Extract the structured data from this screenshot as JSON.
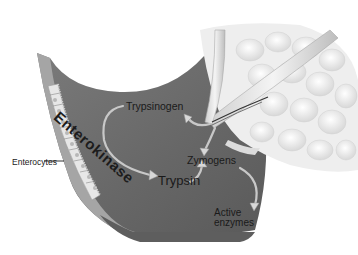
{
  "diagram": {
    "labels": {
      "enterokinase": "Enterokinase",
      "trypsinogen": "Trypsinogen",
      "zymogens": "Zymogens",
      "trypsin": "Trypsin",
      "active_line1": "Active",
      "active_line2": "enzymes",
      "enterocytes": "Enterocytes"
    },
    "structures": [
      "intestinal-wall",
      "enterocyte-layer",
      "pancreas",
      "pancreatic-duct"
    ],
    "arrows": [
      {
        "from": "Trypsinogen",
        "to": "Trypsin"
      },
      {
        "from": "pancreatic-duct",
        "to": "Trypsinogen"
      },
      {
        "from": "pancreatic-duct",
        "to": "Zymogens"
      },
      {
        "from": "Trypsin",
        "to": "Zymogens"
      },
      {
        "from": "Zymogens",
        "to": "Active enzymes"
      }
    ],
    "colors": {
      "wall": "#6f6f6f",
      "wall_light": "#9a9a9a",
      "cells": "#e6e6e6",
      "pancreas": "#f0f0f0",
      "text": "#1a1a1a"
    }
  }
}
